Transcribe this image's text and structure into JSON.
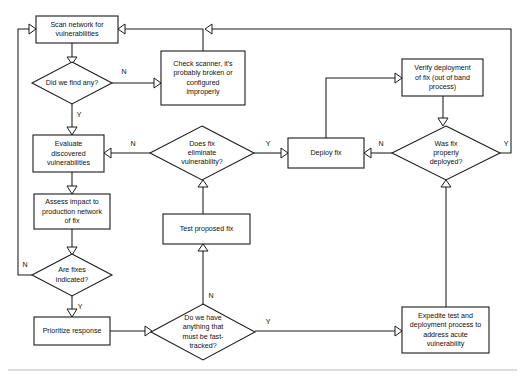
{
  "diagram": {
    "type": "flowchart",
    "background_color": "#ffffff",
    "line_color": "#1a1a1a",
    "text_color": "#111111",
    "footer_rule_color": "#b9b9b9"
  },
  "nodes": [
    {
      "id": "scan",
      "kind": "process",
      "label": "Scan network for vulnerabilities",
      "lines": [
        "Scan network for",
        "vulnerabilities"
      ],
      "x": 36,
      "y": 16,
      "w": 82,
      "h": 27
    },
    {
      "id": "did_find",
      "kind": "decision",
      "label": "Did we find any?",
      "lines": [
        "Did we find any?"
      ],
      "cx": 72,
      "cy": 83,
      "rx": 40,
      "ry": 21
    },
    {
      "id": "check_scanner",
      "kind": "process",
      "label": "Check scanner, it's probably broken or configured improperly",
      "lines": [
        "Check scanner, it's",
        "probably broken or",
        "configured",
        "improperly"
      ],
      "x": 161,
      "y": 51,
      "w": 84,
      "h": 54
    },
    {
      "id": "evaluate",
      "kind": "process",
      "label": "Evaluate discovered vulnerabilities",
      "lines": [
        "Evaluate",
        "discovered",
        "vulnerabilities"
      ],
      "x": 33,
      "y": 135,
      "w": 71,
      "h": 37
    },
    {
      "id": "does_fix",
      "kind": "decision",
      "label": "Does fix eliminate vulnerability?",
      "lines": [
        "Does fix",
        "eliminate",
        "vulnerability?"
      ],
      "cx": 202,
      "cy": 153,
      "rx": 52,
      "ry": 27
    },
    {
      "id": "deploy_fix",
      "kind": "process",
      "label": "Deploy fix",
      "lines": [
        "Deploy fix"
      ],
      "x": 288,
      "y": 138,
      "w": 76,
      "h": 30
    },
    {
      "id": "was_fix",
      "kind": "decision",
      "label": "Was fix properly deployed?",
      "lines": [
        "Was fix",
        "properly",
        "deployed?"
      ],
      "cx": 446,
      "cy": 153,
      "rx": 54,
      "ry": 27
    },
    {
      "id": "verify",
      "kind": "process",
      "label": "Verify deployment of fix (out of band process)",
      "lines": [
        "Verify deployment",
        "of fix (out of band",
        "process)"
      ],
      "x": 402,
      "y": 59,
      "w": 81,
      "h": 37
    },
    {
      "id": "assess",
      "kind": "process",
      "label": "Assess impact to production network of fix",
      "lines": [
        "Assess impact to",
        "production network",
        "of fix"
      ],
      "x": 34,
      "y": 194,
      "w": 76,
      "h": 35
    },
    {
      "id": "are_fixes",
      "kind": "decision",
      "label": "Are fixes indicated?",
      "lines": [
        "Are fixes",
        "indicated?"
      ],
      "cx": 72,
      "cy": 275,
      "rx": 40,
      "ry": 21
    },
    {
      "id": "prioritize",
      "kind": "process",
      "label": "Prioritize response",
      "lines": [
        "Prioritize response"
      ],
      "x": 34,
      "y": 317,
      "w": 76,
      "h": 28
    },
    {
      "id": "test_fix",
      "kind": "process",
      "label": "Test proposed fix",
      "lines": [
        "Test proposed fix"
      ],
      "x": 163,
      "y": 214,
      "w": 87,
      "h": 30
    },
    {
      "id": "fast_track",
      "kind": "decision",
      "label": "Do we have anything that must be fast-tracked?",
      "lines": [
        "Do we have",
        "anything that",
        "must be fast-",
        "tracked?"
      ],
      "cx": 203,
      "cy": 332,
      "rx": 52,
      "ry": 28
    },
    {
      "id": "expedite",
      "kind": "process",
      "label": "Expedite test and deployment process to address acute vulnerability",
      "lines": [
        "Expedite test and",
        "deployment process to",
        "address acute",
        "vulnerability"
      ],
      "x": 402,
      "y": 307,
      "w": 87,
      "h": 46
    }
  ],
  "edges": [
    {
      "id": "e_scan_did",
      "from": "scan",
      "to": "did_find",
      "label": ""
    },
    {
      "id": "e_did_check",
      "from": "did_find",
      "to": "check_scanner",
      "label": "N"
    },
    {
      "id": "e_did_eval",
      "from": "did_find",
      "to": "evaluate",
      "label": "Y"
    },
    {
      "id": "e_check_scan",
      "from": "check_scanner",
      "to": "scan",
      "label": ""
    },
    {
      "id": "e_eval_assess",
      "from": "evaluate",
      "to": "assess",
      "label": ""
    },
    {
      "id": "e_doesfix_eval",
      "from": "does_fix",
      "to": "evaluate",
      "label": "N"
    },
    {
      "id": "e_doesfix_deploy",
      "from": "does_fix",
      "to": "deploy_fix",
      "label": "Y"
    },
    {
      "id": "e_test_doesfix",
      "from": "test_fix",
      "to": "does_fix",
      "label": ""
    },
    {
      "id": "e_deploy_verify",
      "from": "deploy_fix",
      "to": "verify",
      "label": ""
    },
    {
      "id": "e_verify_wasfix",
      "from": "verify",
      "to": "was_fix",
      "label": ""
    },
    {
      "id": "e_wasfix_deploy",
      "from": "was_fix",
      "to": "deploy_fix",
      "label": "N"
    },
    {
      "id": "e_wasfix_scan",
      "from": "was_fix",
      "to": "scan",
      "label": "Y"
    },
    {
      "id": "e_assess_arefixes",
      "from": "assess",
      "to": "are_fixes",
      "label": ""
    },
    {
      "id": "e_arefixes_scan",
      "from": "are_fixes",
      "to": "scan",
      "label": "N"
    },
    {
      "id": "e_arefixes_prior",
      "from": "are_fixes",
      "to": "prioritize",
      "label": "Y"
    },
    {
      "id": "e_prior_fast",
      "from": "prioritize",
      "to": "fast_track",
      "label": ""
    },
    {
      "id": "e_fast_test",
      "from": "fast_track",
      "to": "test_fix",
      "label": "N"
    },
    {
      "id": "e_fast_expedite",
      "from": "fast_track",
      "to": "expedite",
      "label": "Y"
    },
    {
      "id": "e_expedite_wasfix",
      "from": "expedite",
      "to": "was_fix",
      "label": ""
    }
  ],
  "edge_labels": {
    "did_find_no": "N",
    "did_find_yes": "Y",
    "does_fix_no": "N",
    "does_fix_yes": "Y",
    "was_fix_no": "N",
    "was_fix_yes": "Y",
    "are_fixes_no": "N",
    "are_fixes_yes": "Y",
    "fast_track_no": "N",
    "fast_track_yes": "Y"
  }
}
